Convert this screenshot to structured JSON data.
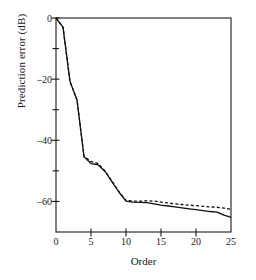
{
  "chart_data": {
    "type": "line",
    "title": "",
    "xlabel": "Order",
    "ylabel": "Prediction error (dB)",
    "xlim": [
      0,
      25
    ],
    "ylim": [
      -70,
      0
    ],
    "xticks": [
      0,
      5,
      10,
      15,
      20,
      25
    ],
    "yticks": [
      0,
      -20,
      -40,
      -60
    ],
    "yticks_minor": [
      -10,
      -30,
      -50
    ],
    "xtick_labels": [
      "0",
      "5",
      "10",
      "15",
      "20",
      "25"
    ],
    "ytick_labels": [
      "0",
      "–20",
      "–40",
      "–60"
    ],
    "grid": false,
    "legend": "none",
    "frame": "box",
    "x": [
      0,
      1,
      2,
      3,
      4,
      5,
      6,
      7,
      8,
      9,
      10,
      11,
      12,
      13,
      14,
      15,
      16,
      17,
      18,
      19,
      20,
      21,
      22,
      23,
      24,
      25
    ],
    "series": [
      {
        "name": "solid-curve",
        "style": "solid",
        "color": "#111111",
        "values": [
          0,
          -3.0,
          -20.8,
          -26.8,
          -45.4,
          -47.6,
          -48.0,
          -50.2,
          -53.6,
          -57.0,
          -59.9,
          -60.2,
          -60.3,
          -60.4,
          -60.8,
          -61.2,
          -61.5,
          -61.8,
          -62.1,
          -62.4,
          -62.7,
          -63.0,
          -63.3,
          -63.5,
          -64.5,
          -65.2
        ]
      },
      {
        "name": "dashed-curve",
        "style": "dashed",
        "color": "#111111",
        "values": [
          0,
          -3.0,
          -20.8,
          -26.8,
          -45.2,
          -46.9,
          -47.6,
          -50.0,
          -53.4,
          -56.8,
          -59.7,
          -59.9,
          -59.9,
          -59.8,
          -59.9,
          -60.2,
          -60.5,
          -60.8,
          -61.0,
          -61.2,
          -61.4,
          -61.6,
          -61.8,
          -61.9,
          -62.2,
          -62.6
        ]
      }
    ]
  },
  "figure": {
    "axis_x_label": "Order",
    "axis_y_label": "Prediction error (dB)"
  }
}
